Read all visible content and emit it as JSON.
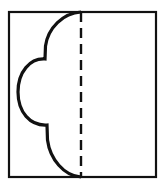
{
  "figure": {
    "title": "Folded paper cut-out diagram",
    "canvas": {
      "width": 166,
      "height": 186,
      "background_color": "#ffffff"
    },
    "frame": {
      "label": "outer-square-outline",
      "x": 9,
      "y": 12,
      "width": 147,
      "height": 165,
      "stroke_color": "#111111",
      "stroke_width": 2.2,
      "fill_color": "#ffffff"
    },
    "fold_line": {
      "label": "vertical-dashed-fold-line",
      "x": 81,
      "y_start": 12,
      "y_end": 177,
      "stroke_color": "#111111",
      "stroke_width": 2.4,
      "dash_length": 10,
      "gap_length": 6,
      "dash_array": "10 6"
    },
    "scallop": {
      "label": "three-lobe-scalloped-cut-curve",
      "stroke_color": "#111111",
      "stroke_width": 3.2,
      "fill": "none",
      "lobe_count": 3,
      "path": "M 81 12 C 63 13 48 28 45.5 46 L 45 59 C 30 58 18 72 18 92 C 18 112 30 126 47 125 L 47.5 140 C 50 159 64 176 81 177",
      "lobes": [
        {
          "name": "top-lobe",
          "start_point": [
            81,
            12
          ],
          "end_point": [
            45,
            59
          ],
          "leftmost_x": 45,
          "span_y": [
            12,
            59
          ]
        },
        {
          "name": "middle-lobe",
          "start_point": [
            45,
            59
          ],
          "end_point": [
            47,
            125
          ],
          "leftmost_x": 18,
          "span_y": [
            59,
            125
          ]
        },
        {
          "name": "bottom-lobe",
          "start_point": [
            47,
            125
          ],
          "end_point": [
            81,
            177
          ],
          "leftmost_x": 47,
          "span_y": [
            125,
            177
          ]
        }
      ],
      "cusps": [
        {
          "name": "upper-cusp",
          "x": 45,
          "y": 59
        },
        {
          "name": "lower-cusp",
          "x": 47,
          "y": 125
        }
      ]
    }
  }
}
